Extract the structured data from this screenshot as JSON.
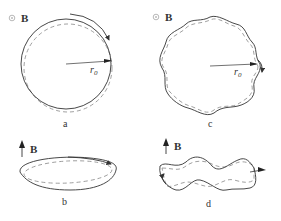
{
  "panels": [
    {
      "id": "a",
      "caption": "a",
      "field_label": "B",
      "field_symbol": "out-of-page-dot-icon",
      "radius_label": "r",
      "radius_subscript": "0",
      "shape": "circle"
    },
    {
      "id": "c",
      "caption": "c",
      "field_label": "B",
      "field_symbol": "out-of-page-dot-icon",
      "radius_label": "r",
      "radius_subscript": "0",
      "shape": "wavy-circle"
    },
    {
      "id": "b",
      "caption": "b",
      "field_label": "B",
      "field_symbol": "up-arrow-icon",
      "shape": "ellipse"
    },
    {
      "id": "d",
      "caption": "d",
      "field_label": "B",
      "field_symbol": "up-arrow-icon",
      "shape": "wavy-ellipse"
    }
  ],
  "colors": {
    "stroke": "#333333",
    "dashed": "#888888",
    "background": "#ffffff"
  }
}
